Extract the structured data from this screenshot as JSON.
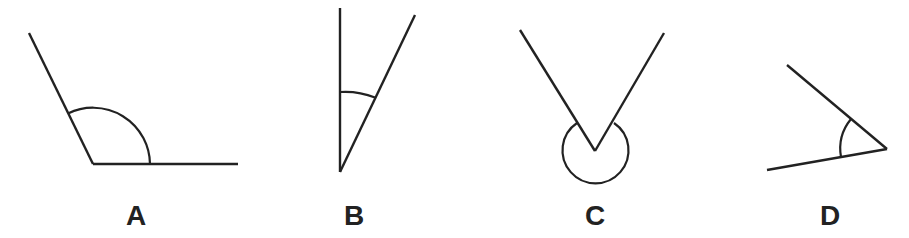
{
  "figure": {
    "stroke_color": "#222222",
    "background": "#ffffff"
  },
  "angles": [
    {
      "label": "A",
      "type": "obtuse",
      "vertex": [
        93,
        164
      ],
      "arm1_end": [
        29,
        33
      ],
      "arm2_end": [
        238,
        164
      ],
      "arc": "M150,164 A57,57 0 0 0 68,113.5",
      "label_pos": [
        136,
        225
      ]
    },
    {
      "label": "B",
      "type": "acute",
      "vertex": [
        340,
        172
      ],
      "arm1_end": [
        340,
        8
      ],
      "arm2_end": [
        415,
        15
      ],
      "arc": "M340,92 A80,80 0 0 1 375,97.5",
      "label_pos": [
        354,
        225
      ]
    },
    {
      "label": "C",
      "type": "reflex",
      "vertex": [
        595,
        151
      ],
      "arm1_end": [
        520,
        30
      ],
      "arm2_end": [
        664,
        33
      ],
      "arc": "M577,123 A33,33 0 1 0 614,123",
      "label_pos": [
        595,
        225
      ]
    },
    {
      "label": "D",
      "type": "acute",
      "vertex": [
        887,
        149
      ],
      "arm1_end": [
        787,
        65
      ],
      "arm2_end": [
        767,
        170
      ],
      "arc": "M851,119 A47,47 0 0 0 841,157",
      "label_pos": [
        830,
        225
      ]
    }
  ]
}
